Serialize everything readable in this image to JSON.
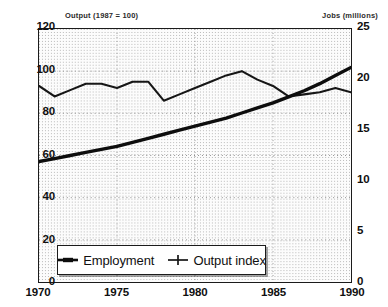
{
  "chart_data": {
    "type": "line",
    "title": "",
    "left_axis": {
      "label": "Output (1987 = 100)",
      "ticks": [
        0,
        20,
        40,
        60,
        80,
        100,
        120
      ],
      "ylim": [
        0,
        120
      ]
    },
    "right_axis": {
      "label": "Jobs (millions)",
      "ticks": [
        0,
        5,
        10,
        15,
        20,
        25
      ],
      "ylim": [
        0,
        25
      ]
    },
    "xlabel": "",
    "x_ticks": [
      "1970",
      "1975",
      "1980",
      "1985",
      "1990"
    ],
    "xlim": [
      1970,
      1990
    ],
    "grid": true,
    "legend_position": "bottom-left-inside",
    "series": [
      {
        "name": "Employment",
        "axis": "right",
        "unit": "millions",
        "marker": "dash",
        "x": [
          1970,
          1971,
          1972,
          1973,
          1974,
          1975,
          1976,
          1977,
          1978,
          1979,
          1980,
          1981,
          1982,
          1983,
          1984,
          1985,
          1986,
          1987,
          1988,
          1989,
          1990
        ],
        "values": [
          11.9,
          12.2,
          12.5,
          12.8,
          13.1,
          13.4,
          13.8,
          14.2,
          14.6,
          15.0,
          15.4,
          15.8,
          16.2,
          16.7,
          17.2,
          17.7,
          18.3,
          18.9,
          19.6,
          20.4,
          21.2
        ]
      },
      {
        "name": "Output index",
        "axis": "left",
        "unit": "index (1987 = 100)",
        "marker": "plus",
        "x": [
          1970,
          1971,
          1972,
          1973,
          1974,
          1975,
          1976,
          1977,
          1978,
          1979,
          1980,
          1981,
          1982,
          1983,
          1984,
          1985,
          1986,
          1987,
          1988,
          1989,
          1990
        ],
        "values": [
          93,
          88,
          91,
          94,
          94,
          92,
          95,
          95,
          86,
          89,
          92,
          95,
          98,
          100,
          96,
          93,
          88,
          89,
          90,
          92,
          90
        ]
      }
    ]
  },
  "legend": {
    "entries": [
      {
        "label": "Employment",
        "marker": "dash-marker"
      },
      {
        "label": "Output index",
        "marker": "plus-marker"
      }
    ]
  }
}
